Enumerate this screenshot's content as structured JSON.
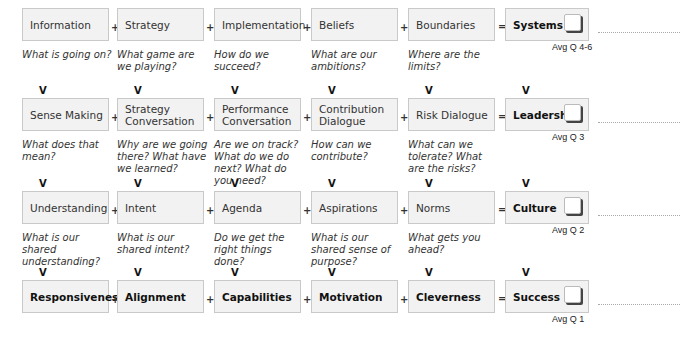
{
  "rows": [
    {
      "items": [
        "Information",
        "Strategy",
        "Implementation",
        "Beliefs",
        "Boundaries"
      ],
      "questions": [
        "What is going on?",
        "What game are we playing?",
        "How do we succeed?",
        "What are our ambitions?",
        "Where are the limits?"
      ],
      "result": "Systems",
      "avg": "Avg Q 4-6"
    },
    {
      "items": [
        "Sense Making",
        "Strategy Conversation",
        "Performance Conversation",
        "Contribution Dialogue",
        "Risk Dialogue"
      ],
      "questions": [
        "What does that mean?",
        "Why are we going there? What have we learned?",
        "Are we on track? What do we do next? What do you need?",
        "How can we contribute?",
        "What can we tolerate? What are the risks?"
      ],
      "result": "Leadership",
      "avg": "Avg Q 3"
    },
    {
      "items": [
        "Understanding",
        "Intent",
        "Agenda",
        "Aspirations",
        "Norms"
      ],
      "questions": [
        "What is our shared understanding?",
        "What is our shared intent?",
        "Do we get the right things done?",
        "What is our shared sense of purpose?",
        "What gets you ahead?"
      ],
      "result": "Culture",
      "avg": "Avg Q 2"
    },
    {
      "items": [
        "Responsiveness",
        "Alignment",
        "Capabilities",
        "Motivation",
        "Cleverness"
      ],
      "questions": [],
      "result": "Success",
      "avg": "Avg Q 1"
    }
  ],
  "symbols": {
    "plus": "+",
    "equals": "=",
    "down": "V"
  }
}
